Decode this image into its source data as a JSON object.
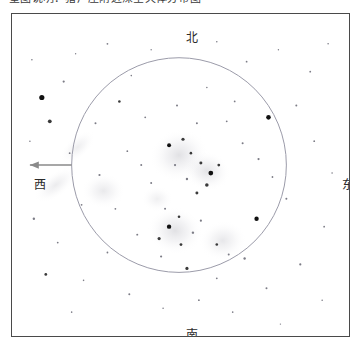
{
  "caption": {
    "text": "星图说明：猎户座附近深空天体分布图"
  },
  "chart": {
    "title": "",
    "frame": {
      "border_color": "#4a4a4a"
    },
    "directions": {
      "north": "北",
      "south": "南",
      "west": "西",
      "east": "东"
    },
    "arrow": {
      "name": "west-arrow",
      "direction": "west",
      "color": "#8a8a8a"
    },
    "field_circle": {
      "color": "#9a9aa8",
      "center_x": 168,
      "center_y": 152,
      "radius": 108
    }
  },
  "chart_data": {
    "type": "scatter",
    "title": "",
    "xlabel": "",
    "ylabel": "",
    "xlim": [
      0,
      339
    ],
    "ylim": [
      0,
      324
    ],
    "grid": false,
    "legend": null,
    "background": "#ffffff",
    "field_circle": {
      "cx": 168,
      "cy": 152,
      "r": 108,
      "stroke": "#9a9aa8"
    },
    "nebulae": [
      {
        "cx": 168,
        "cy": 142,
        "rx": 30,
        "ry": 26,
        "rot": -20,
        "opacity": 0.3
      },
      {
        "cx": 196,
        "cy": 158,
        "rx": 24,
        "ry": 20,
        "rot": 15,
        "opacity": 0.28
      },
      {
        "cx": 164,
        "cy": 218,
        "rx": 28,
        "ry": 24,
        "rot": 10,
        "opacity": 0.3
      },
      {
        "cx": 212,
        "cy": 228,
        "rx": 24,
        "ry": 20,
        "rot": -10,
        "opacity": 0.24
      },
      {
        "cx": 92,
        "cy": 178,
        "rx": 22,
        "ry": 18,
        "rot": 0,
        "opacity": 0.22
      },
      {
        "cx": 44,
        "cy": 172,
        "rx": 26,
        "ry": 12,
        "rot": -38,
        "opacity": 0.2
      },
      {
        "cx": 66,
        "cy": 134,
        "rx": 22,
        "ry": 11,
        "rot": -42,
        "opacity": 0.18
      },
      {
        "cx": 146,
        "cy": 186,
        "rx": 16,
        "ry": 13,
        "rot": 0,
        "opacity": 0.16
      }
    ],
    "stars": [
      {
        "x": 30,
        "y": 84,
        "r": 2.6
      },
      {
        "x": 52,
        "y": 68,
        "r": 1.1
      },
      {
        "x": 38,
        "y": 108,
        "r": 1.9
      },
      {
        "x": 20,
        "y": 46,
        "r": 0.8
      },
      {
        "x": 64,
        "y": 40,
        "r": 0.7
      },
      {
        "x": 96,
        "y": 30,
        "r": 0.9
      },
      {
        "x": 120,
        "y": 62,
        "r": 0.8
      },
      {
        "x": 140,
        "y": 36,
        "r": 0.7
      },
      {
        "x": 206,
        "y": 28,
        "r": 0.8
      },
      {
        "x": 236,
        "y": 48,
        "r": 0.9
      },
      {
        "x": 268,
        "y": 36,
        "r": 0.7
      },
      {
        "x": 300,
        "y": 58,
        "r": 0.9
      },
      {
        "x": 318,
        "y": 30,
        "r": 0.8
      },
      {
        "x": 286,
        "y": 92,
        "r": 1.0
      },
      {
        "x": 258,
        "y": 104,
        "r": 2.3
      },
      {
        "x": 224,
        "y": 88,
        "r": 0.9
      },
      {
        "x": 196,
        "y": 74,
        "r": 0.8
      },
      {
        "x": 166,
        "y": 92,
        "r": 1.0
      },
      {
        "x": 134,
        "y": 104,
        "r": 0.9
      },
      {
        "x": 108,
        "y": 88,
        "r": 1.3
      },
      {
        "x": 84,
        "y": 110,
        "r": 1.0
      },
      {
        "x": 58,
        "y": 140,
        "r": 0.9
      },
      {
        "x": 30,
        "y": 168,
        "r": 1.0
      },
      {
        "x": 22,
        "y": 206,
        "r": 1.2
      },
      {
        "x": 46,
        "y": 230,
        "r": 0.9
      },
      {
        "x": 34,
        "y": 262,
        "r": 1.4
      },
      {
        "x": 72,
        "y": 268,
        "r": 0.8
      },
      {
        "x": 96,
        "y": 240,
        "r": 0.9
      },
      {
        "x": 118,
        "y": 282,
        "r": 1.0
      },
      {
        "x": 152,
        "y": 296,
        "r": 0.8
      },
      {
        "x": 188,
        "y": 288,
        "r": 0.9
      },
      {
        "x": 222,
        "y": 300,
        "r": 0.8
      },
      {
        "x": 256,
        "y": 276,
        "r": 1.0
      },
      {
        "x": 290,
        "y": 252,
        "r": 1.1
      },
      {
        "x": 314,
        "y": 214,
        "r": 0.9
      },
      {
        "x": 322,
        "y": 160,
        "r": 0.8
      },
      {
        "x": 304,
        "y": 128,
        "r": 0.9
      },
      {
        "x": 276,
        "y": 186,
        "r": 1.0
      },
      {
        "x": 246,
        "y": 206,
        "r": 2.2
      },
      {
        "x": 234,
        "y": 246,
        "r": 1.2
      },
      {
        "x": 206,
        "y": 266,
        "r": 0.9
      },
      {
        "x": 176,
        "y": 256,
        "r": 1.6
      },
      {
        "x": 150,
        "y": 244,
        "r": 1.1
      },
      {
        "x": 126,
        "y": 222,
        "r": 1.0
      },
      {
        "x": 104,
        "y": 196,
        "r": 0.9
      },
      {
        "x": 140,
        "y": 170,
        "r": 1.0
      },
      {
        "x": 158,
        "y": 132,
        "r": 2.0
      },
      {
        "x": 172,
        "y": 126,
        "r": 1.6
      },
      {
        "x": 180,
        "y": 140,
        "r": 1.3
      },
      {
        "x": 190,
        "y": 150,
        "r": 1.5
      },
      {
        "x": 200,
        "y": 160,
        "r": 2.4
      },
      {
        "x": 208,
        "y": 152,
        "r": 1.4
      },
      {
        "x": 196,
        "y": 172,
        "r": 1.8
      },
      {
        "x": 186,
        "y": 180,
        "r": 1.5
      },
      {
        "x": 176,
        "y": 166,
        "r": 1.2
      },
      {
        "x": 164,
        "y": 152,
        "r": 1.1
      },
      {
        "x": 154,
        "y": 196,
        "r": 1.0
      },
      {
        "x": 168,
        "y": 204,
        "r": 1.3
      },
      {
        "x": 158,
        "y": 214,
        "r": 2.2
      },
      {
        "x": 148,
        "y": 226,
        "r": 1.6
      },
      {
        "x": 170,
        "y": 232,
        "r": 1.4
      },
      {
        "x": 182,
        "y": 220,
        "r": 1.2
      },
      {
        "x": 190,
        "y": 208,
        "r": 1.1
      },
      {
        "x": 206,
        "y": 232,
        "r": 1.3
      },
      {
        "x": 218,
        "y": 242,
        "r": 1.0
      },
      {
        "x": 130,
        "y": 152,
        "r": 1.0
      },
      {
        "x": 116,
        "y": 138,
        "r": 0.9
      },
      {
        "x": 88,
        "y": 162,
        "r": 1.1
      },
      {
        "x": 70,
        "y": 192,
        "r": 0.9
      },
      {
        "x": 232,
        "y": 130,
        "r": 1.0
      },
      {
        "x": 248,
        "y": 146,
        "r": 1.1
      },
      {
        "x": 262,
        "y": 164,
        "r": 0.9
      },
      {
        "x": 216,
        "y": 108,
        "r": 0.9
      },
      {
        "x": 186,
        "y": 110,
        "r": 1.0
      },
      {
        "x": 60,
        "y": 300,
        "r": 0.8
      },
      {
        "x": 270,
        "y": 312,
        "r": 0.7
      },
      {
        "x": 312,
        "y": 288,
        "r": 0.8
      },
      {
        "x": 18,
        "y": 128,
        "r": 0.8
      }
    ]
  }
}
